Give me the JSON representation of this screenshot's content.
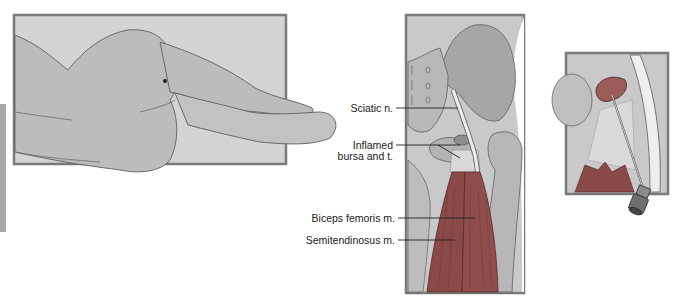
{
  "figure": {
    "panels": [
      {
        "id": "patient-position",
        "description": "Patient lying lateral decubitus with injection site marked on buttock"
      },
      {
        "id": "anatomy",
        "description": "Posterior hip anatomy"
      },
      {
        "id": "injection-detail",
        "description": "Needle injection into inflamed bursa"
      }
    ],
    "labels": [
      {
        "id": "sciatic",
        "text": "Sciatic n."
      },
      {
        "id": "inflamed-1",
        "text": "Inflamed"
      },
      {
        "id": "inflamed-2",
        "text": "bursa and t."
      },
      {
        "id": "biceps",
        "text": "Biceps femoris m."
      },
      {
        "id": "semitendinosus",
        "text": "Semitendinosus m."
      }
    ],
    "colors": {
      "panel_border": "#7a7a7a",
      "background_panel": "#cfcfcf",
      "skin": "#bdbdbd",
      "bone": "#a9a9a9",
      "muscle": "#8a4a48",
      "nerve": "#eeeeee",
      "bursa": "#9b5a55",
      "side_tab": "#a8a8a8"
    }
  }
}
